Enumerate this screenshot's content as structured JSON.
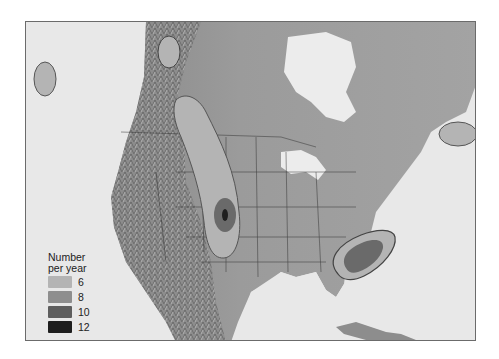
{
  "map": {
    "title": "",
    "region": "North America",
    "legend": {
      "title_line1": "Number",
      "title_line2": "per year",
      "items": [
        {
          "label": "6",
          "color": "#b4b4b4"
        },
        {
          "label": "8",
          "color": "#8e8e8e"
        },
        {
          "label": "10",
          "color": "#5e5e5e"
        },
        {
          "label": "12",
          "color": "#1e1e1e"
        }
      ]
    },
    "zones": [
      {
        "name": "great-plains-corridor",
        "levels": [
          "6",
          "10",
          "12"
        ]
      },
      {
        "name": "southeast-us",
        "levels": [
          "6",
          "8"
        ]
      },
      {
        "name": "pacific-offshore",
        "levels": [
          "6"
        ]
      },
      {
        "name": "western-canada",
        "levels": [
          "6"
        ]
      },
      {
        "name": "atlantic-offshore",
        "levels": [
          "6"
        ]
      }
    ]
  }
}
